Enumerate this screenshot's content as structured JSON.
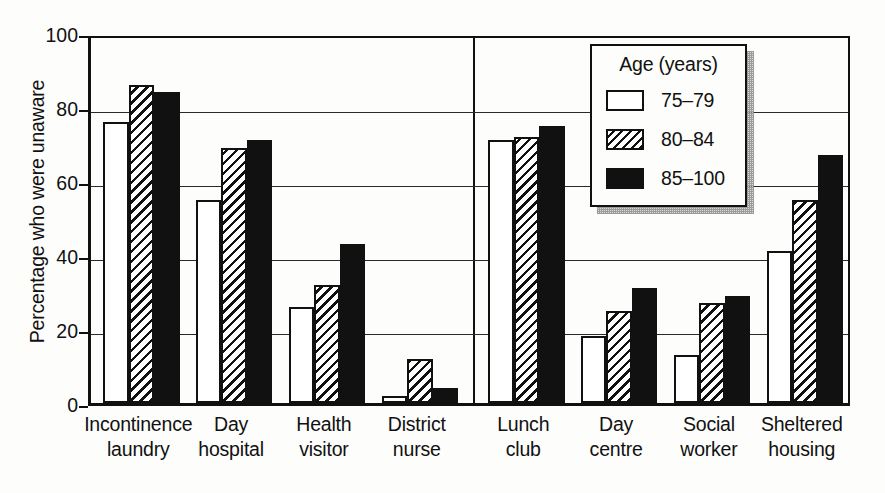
{
  "chart_data": {
    "type": "bar",
    "title": "",
    "xlabel": "",
    "ylabel": "Percentage who were unaware",
    "ylim": [
      0,
      100
    ],
    "yticks": [
      0,
      20,
      40,
      60,
      80,
      100
    ],
    "grid": true,
    "legend": {
      "title": "Age (years)",
      "position": "top-right",
      "entries": [
        {
          "label": "75–79",
          "fill": "white",
          "color": "#ffffff"
        },
        {
          "label": "80–84",
          "fill": "hatched",
          "color": "#ffffff"
        },
        {
          "label": "85–100",
          "fill": "solid",
          "color": "#111111"
        }
      ]
    },
    "panel_break_after_category": 4,
    "categories": [
      "Incontinence laundry",
      "Day hospital",
      "Health visitor",
      "District nurse",
      "Lunch club",
      "Day centre",
      "Social worker",
      "Sheltered housing"
    ],
    "category_lines": [
      [
        "Incontinence",
        "laundry"
      ],
      [
        "Day",
        "hospital"
      ],
      [
        "Health",
        "visitor"
      ],
      [
        "District",
        "nurse"
      ],
      [
        "Lunch",
        "club"
      ],
      [
        "Day",
        "centre"
      ],
      [
        "Social",
        "worker"
      ],
      [
        "Sheltered",
        "housing"
      ]
    ],
    "series": [
      {
        "name": "75–79",
        "values": [
          76,
          55,
          26,
          2,
          71,
          18,
          13,
          41
        ]
      },
      {
        "name": "80–84",
        "values": [
          86,
          69,
          32,
          12,
          72,
          25,
          27,
          55
        ]
      },
      {
        "name": "85–100",
        "values": [
          84,
          71,
          43,
          4,
          75,
          31,
          29,
          67
        ]
      }
    ]
  }
}
